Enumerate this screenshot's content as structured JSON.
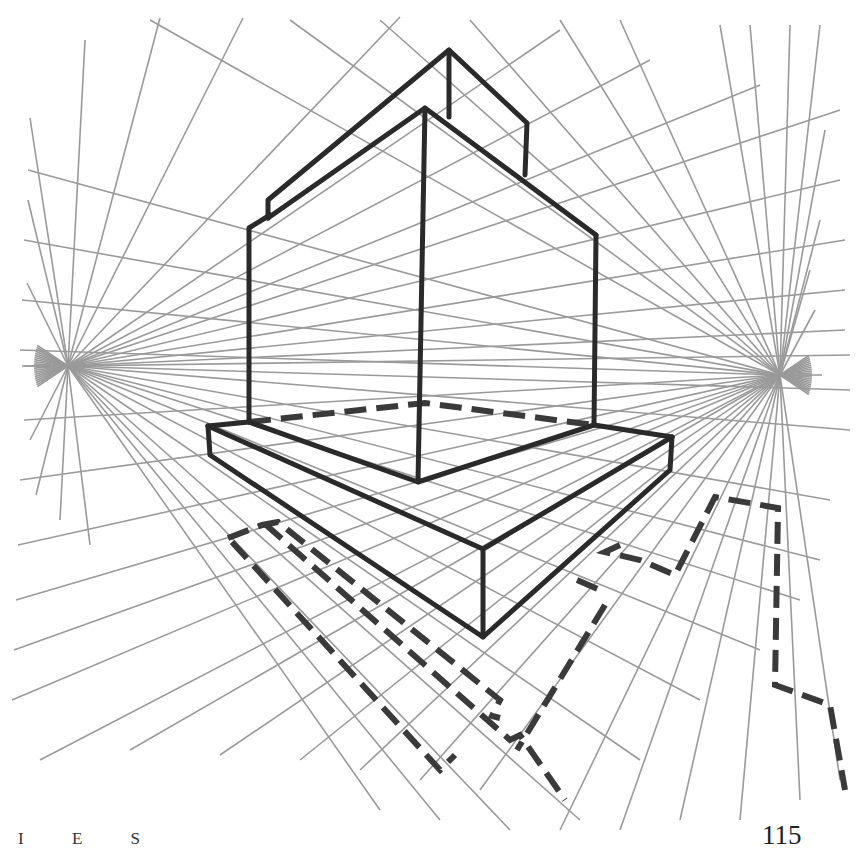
{
  "page": {
    "running_header": "I E S",
    "page_number": "115"
  },
  "diagram": {
    "colors": {
      "guide_lines": "#9a9a9a",
      "object_lines": "#2a2a2a",
      "background": "#ffffff"
    },
    "vanishing_points": {
      "left": {
        "x": 68,
        "y": 366
      },
      "right": {
        "x": 780,
        "y": 375
      }
    },
    "left_vp_rays_to": [
      [
        400,
        17
      ],
      [
        243,
        18
      ],
      [
        160,
        18
      ],
      [
        85,
        40
      ],
      [
        30,
        118
      ],
      [
        28,
        200
      ],
      [
        27,
        283
      ],
      [
        24,
        366
      ],
      [
        30,
        440
      ],
      [
        36,
        495
      ],
      [
        60,
        520
      ],
      [
        90,
        545
      ],
      [
        560,
        30
      ],
      [
        650,
        60
      ],
      [
        760,
        85
      ],
      [
        840,
        110
      ],
      [
        840,
        180
      ],
      [
        845,
        240
      ],
      [
        845,
        290
      ],
      [
        845,
        330
      ],
      [
        850,
        355
      ],
      [
        850,
        390
      ],
      [
        850,
        430
      ],
      [
        830,
        500
      ],
      [
        820,
        560
      ],
      [
        800,
        600
      ],
      [
        760,
        650
      ],
      [
        700,
        700
      ],
      [
        640,
        760
      ],
      [
        580,
        820
      ],
      [
        510,
        830
      ],
      [
        440,
        820
      ],
      [
        380,
        810
      ]
    ],
    "right_vp_rays_to": [
      [
        28,
        170
      ],
      [
        24,
        240
      ],
      [
        22,
        300
      ],
      [
        20,
        350
      ],
      [
        24,
        420
      ],
      [
        20,
        480
      ],
      [
        18,
        545
      ],
      [
        16,
        600
      ],
      [
        14,
        650
      ],
      [
        12,
        700
      ],
      [
        40,
        760
      ],
      [
        130,
        750
      ],
      [
        220,
        755
      ],
      [
        300,
        760
      ],
      [
        360,
        770
      ],
      [
        420,
        780
      ],
      [
        480,
        790
      ],
      [
        150,
        20
      ],
      [
        290,
        20
      ],
      [
        380,
        20
      ],
      [
        470,
        20
      ],
      [
        560,
        20
      ],
      [
        620,
        20
      ],
      [
        720,
        25
      ],
      [
        750,
        25
      ],
      [
        790,
        25
      ],
      [
        820,
        25
      ],
      [
        825,
        130
      ],
      [
        820,
        220
      ],
      [
        810,
        270
      ],
      [
        815,
        310
      ],
      [
        560,
        830
      ],
      [
        620,
        830
      ],
      [
        680,
        820
      ],
      [
        740,
        820
      ],
      [
        800,
        800
      ],
      [
        840,
        780
      ]
    ],
    "solid_edges": [
      [
        [
          268,
          218
        ],
        [
          268,
          200
        ],
        [
          449,
          50
        ],
        [
          527,
          123
        ],
        [
          525,
          175
        ]
      ],
      [
        [
          449,
          50
        ],
        [
          449,
          117
        ]
      ],
      [
        [
          268,
          218
        ],
        [
          425,
          108
        ],
        [
          596,
          235
        ]
      ],
      [
        [
          249,
          422
        ],
        [
          249,
          228
        ],
        [
          270,
          215
        ]
      ],
      [
        [
          425,
          108
        ],
        [
          418,
          482
        ]
      ],
      [
        [
          596,
          235
        ],
        [
          594,
          425
        ]
      ],
      [
        [
          249,
          422
        ],
        [
          418,
          482
        ],
        [
          594,
          425
        ]
      ],
      [
        [
          208,
          426
        ],
        [
          483,
          549
        ],
        [
          672,
          437
        ]
      ],
      [
        [
          208,
          426
        ],
        [
          249,
          422
        ]
      ],
      [
        [
          594,
          425
        ],
        [
          672,
          437
        ]
      ],
      [
        [
          208,
          426
        ],
        [
          210,
          455
        ],
        [
          483,
          637
        ],
        [
          670,
          470
        ],
        [
          672,
          437
        ]
      ],
      [
        [
          483,
          549
        ],
        [
          483,
          637
        ]
      ]
    ],
    "dashed_edges": [
      [
        [
          249,
          422
        ],
        [
          425,
          403
        ],
        [
          594,
          425
        ]
      ],
      [
        [
          228,
          538
        ],
        [
          262,
          525
        ],
        [
          278,
          522
        ],
        [
          500,
          700
        ],
        [
          492,
          716
        ],
        [
          500,
          718
        ]
      ],
      [
        [
          232,
          542
        ],
        [
          440,
          770
        ],
        [
          455,
          755
        ]
      ],
      [
        [
          265,
          524
        ],
        [
          510,
          740
        ],
        [
          520,
          735
        ],
        [
          565,
          800
        ]
      ],
      [
        [
          620,
          545
        ],
        [
          605,
          552
        ],
        [
          640,
          560
        ],
        [
          675,
          575
        ],
        [
          715,
          497
        ],
        [
          778,
          508
        ],
        [
          775,
          685
        ],
        [
          830,
          705
        ],
        [
          845,
          790
        ]
      ],
      [
        [
          577,
          580
        ],
        [
          600,
          590
        ]
      ],
      [
        [
          605,
          605
        ],
        [
          517,
          750
        ]
      ]
    ]
  }
}
